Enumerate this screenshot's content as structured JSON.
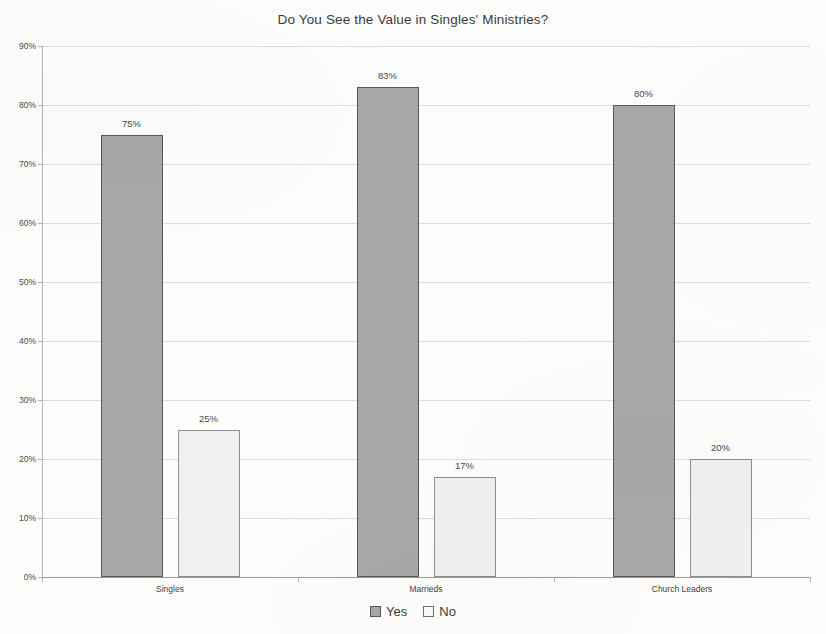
{
  "chart_data": {
    "type": "bar",
    "title": "Do You See the Value in Singles' Ministries?",
    "xlabel": "",
    "ylabel": "",
    "ylim": [
      0,
      90
    ],
    "ytick_labels": [
      "0%",
      "10%",
      "20%",
      "30%",
      "40%",
      "50%",
      "60%",
      "70%",
      "80%",
      "90%"
    ],
    "ytick_values": [
      0,
      10,
      20,
      30,
      40,
      50,
      60,
      70,
      80,
      90
    ],
    "grid": true,
    "legend_position": "bottom",
    "categories": [
      "Singles",
      "Marrieds",
      "Church Leaders"
    ],
    "series": [
      {
        "name": "Yes",
        "color": "#a8a8a8",
        "border_color": "#575757",
        "values": [
          75,
          83,
          80
        ],
        "labels": [
          "75%",
          "83%",
          "80%"
        ]
      },
      {
        "name": "No",
        "color": "#f0f0f0",
        "border_color": "#8e8e8e",
        "values": [
          25,
          17,
          20
        ],
        "labels": [
          "25%",
          "17%",
          "20%"
        ]
      }
    ]
  }
}
